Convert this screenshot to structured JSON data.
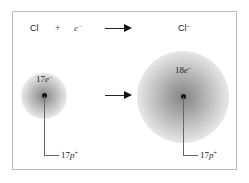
{
  "equation": {
    "reactant_atom": "Cl",
    "plus": "+",
    "electron_symbol": "e",
    "electron_charge": "−",
    "product_ion": "Cl",
    "product_charge": "−"
  },
  "atom_left": {
    "electron_count": "17",
    "electron_symbol": "e",
    "electron_charge": "−",
    "proton_count": "17",
    "proton_symbol": "p",
    "proton_charge": "+"
  },
  "atom_right": {
    "electron_count": "18",
    "electron_symbol": "e",
    "electron_charge": "−",
    "proton_count": "17",
    "proton_symbol": "p",
    "proton_charge": "+"
  },
  "colors": {
    "cloud": "#7a7a7a",
    "nucleus": "#111111",
    "border": "#bdbdbd"
  }
}
